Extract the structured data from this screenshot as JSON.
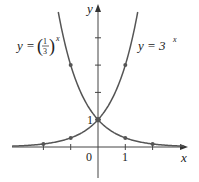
{
  "chart_data": {
    "type": "line",
    "title": "",
    "xlabel": "x",
    "ylabel": "y",
    "xlim": [
      -3.2,
      3.3
    ],
    "ylim": [
      -1.2,
      5.3
    ],
    "grid": false,
    "legend_position": "inline labels",
    "x_ticks": [
      -2,
      -1,
      1,
      2
    ],
    "x_tick_labels": {
      "0": "0",
      "1": "1"
    },
    "y_ticks": [
      1,
      2,
      3,
      4
    ],
    "y_tick_labels": {
      "1": "1"
    },
    "series": [
      {
        "name": "y = (1/3)^x",
        "label_base": "y = ",
        "label_num": "1",
        "label_den": "3",
        "label_exp": "x",
        "function": "(1/3)^x",
        "color": "#555555",
        "marked_points": [
          [
            -1,
            3
          ],
          [
            0,
            1
          ],
          [
            1,
            0.3333
          ],
          [
            2,
            0.1111
          ]
        ]
      },
      {
        "name": "y = 3^x",
        "label_base": "y = 3",
        "label_exp": "x",
        "function": "3^x",
        "color": "#555555",
        "marked_points": [
          [
            -2,
            0.1111
          ],
          [
            -1,
            0.3333
          ],
          [
            0,
            1
          ],
          [
            1,
            3
          ]
        ]
      }
    ],
    "annotations": [
      {
        "text": "1",
        "at": [
          0,
          1
        ],
        "position": "left"
      },
      {
        "text": "0",
        "at": [
          0,
          0
        ],
        "position": "below-left"
      }
    ]
  },
  "axes": {
    "x_label": "x",
    "y_label": "y",
    "origin_label": "0",
    "x_one_label": "1",
    "y_one_label": "1"
  },
  "labels": {
    "left_curve": {
      "prefix": "y = ",
      "num": "1",
      "den": "3",
      "exp": "x"
    },
    "right_curve": {
      "prefix": "y = 3",
      "exp": "x"
    }
  },
  "colors": {
    "axis": "#444444",
    "curve": "#555555",
    "point": "#555555",
    "text": "#222222"
  }
}
